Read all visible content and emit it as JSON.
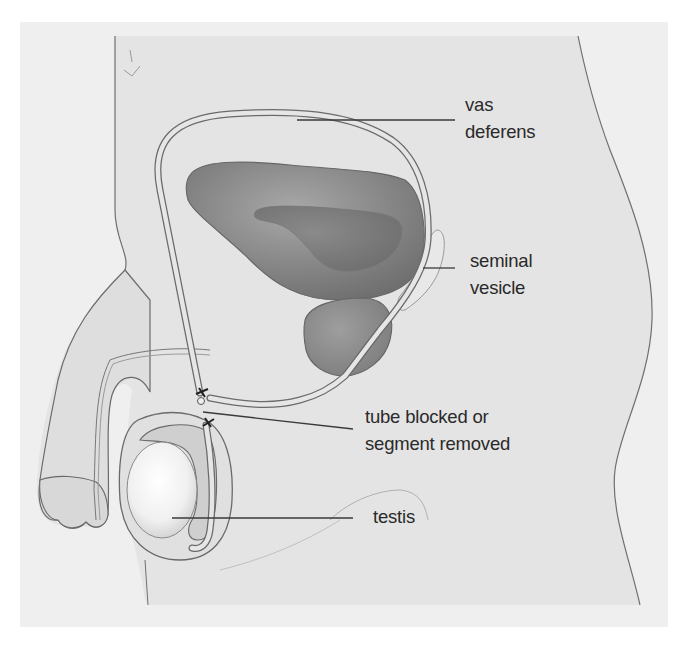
{
  "diagram": {
    "labels": [
      {
        "id": "vas-deferens",
        "lines": [
          "vas",
          "deferens"
        ]
      },
      {
        "id": "seminal-vesicle",
        "lines": [
          "seminal",
          "vesicle"
        ]
      },
      {
        "id": "tube-blocked",
        "lines": [
          "tube blocked or",
          "segment removed"
        ]
      },
      {
        "id": "testis",
        "lines": [
          "testis"
        ]
      }
    ]
  },
  "colors": {
    "background": "#ffffff",
    "panel": "#efefef",
    "body": "#e4e4e4",
    "outline": "#6a6a6a",
    "organ_dark": "#7a7a7a",
    "organ_mid": "#9a9a9a",
    "testis_light": "#fafafa",
    "leader_line": "#3a3a3a",
    "text": "#2a2a2a"
  }
}
